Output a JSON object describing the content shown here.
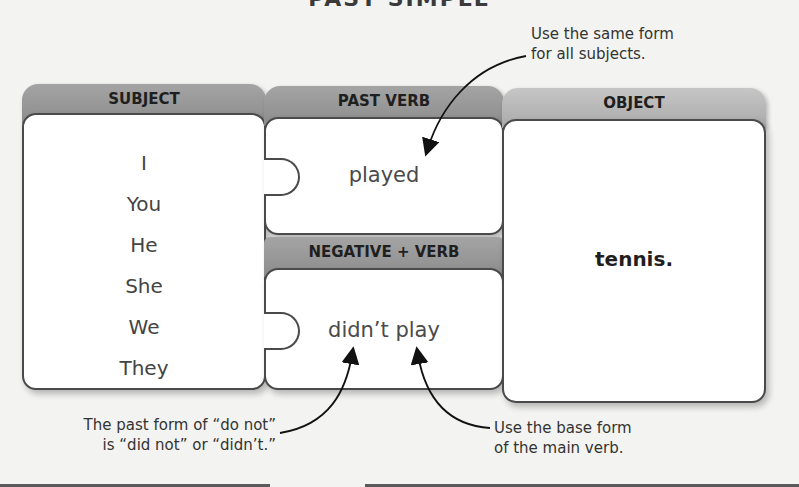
{
  "title_clipped": "PAST SIMPLE",
  "pieces": {
    "subject": {
      "header": "SUBJECT",
      "items": [
        "I",
        "You",
        "He",
        "She",
        "We",
        "They"
      ]
    },
    "past_verb": {
      "header": "PAST VERB",
      "word": "played"
    },
    "negative_verb": {
      "header": "NEGATIVE + VERB",
      "word": "didn’t play"
    },
    "object": {
      "header": "OBJECT",
      "word": "tennis."
    }
  },
  "notes": {
    "top_right": [
      "Use the same form",
      "for all subjects."
    ],
    "bottom_left": [
      "The past form of “do not”",
      "is “did not” or “didn’t.”"
    ],
    "bottom_right": [
      "Use the base form",
      "of the main verb."
    ]
  },
  "colors": {
    "header_dark": "#8c8c8c",
    "header_light": "#a9a9a9",
    "border": "#4a4a4a",
    "background": "#f3f3f1"
  }
}
